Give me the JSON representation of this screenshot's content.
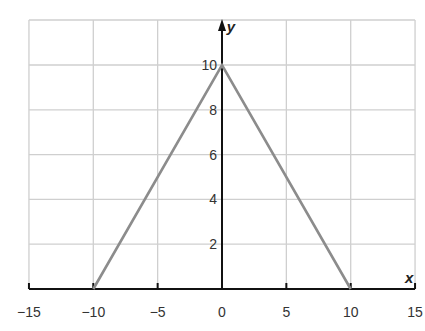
{
  "chart_data": {
    "type": "line",
    "title": "",
    "xlabel": "x",
    "ylabel": "y",
    "xlim": [
      -15,
      15
    ],
    "ylim": [
      0,
      11.9
    ],
    "x_ticks": [
      -15,
      -10,
      -5,
      0,
      5,
      10,
      15
    ],
    "x_tick_labels": [
      "−15",
      "−10",
      "−5",
      "0",
      "5",
      "10",
      "15"
    ],
    "y_ticks": [
      2,
      4,
      6,
      8,
      10
    ],
    "y_tick_labels": [
      "2",
      "4",
      "6",
      "8",
      "10"
    ],
    "grid": true,
    "legend": null,
    "series": [
      {
        "name": "graph",
        "color": "#8c8c8c",
        "x": [
          -10,
          0,
          10
        ],
        "y": [
          0,
          10,
          0
        ]
      }
    ]
  },
  "colors": {
    "grid": "#cfcfcf",
    "axis": "#111111",
    "line": "#8c8c8c"
  },
  "layout": {
    "px_x0": 222,
    "px_per_x": 12.87,
    "px_y0": 289,
    "px_per_y": 22.4,
    "grid_top": 20
  }
}
